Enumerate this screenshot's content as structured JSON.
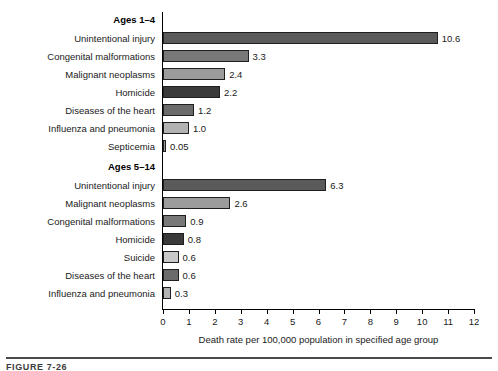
{
  "chart_data": {
    "type": "bar",
    "orientation": "horizontal",
    "title": "",
    "xlabel": "Death rate per 100,000 population in specified age group",
    "ylabel": "",
    "xlim": [
      0,
      12
    ],
    "xticks": [
      "0",
      "1",
      "2",
      "3",
      "4",
      "5",
      "6",
      "7",
      "8",
      "9",
      "10",
      "11",
      "12"
    ],
    "grid": false,
    "legend": "none",
    "panels": [
      {
        "name": "Ages 1–4",
        "categories": [
          "Unintentional injury",
          "Congenital malformations",
          "Malignant neoplasms",
          "Homicide",
          "Diseases of the heart",
          "Influenza and pneumonia",
          "Septicemia"
        ],
        "values": [
          10.6,
          3.3,
          2.4,
          2.2,
          1.2,
          1.0,
          0.05
        ],
        "value_labels": [
          "10.6",
          "3.3",
          "2.4",
          "2.2",
          "1.2",
          "1.0",
          "0.05"
        ],
        "colors": [
          "#5a5a5a",
          "#787878",
          "#9c9c9c",
          "#3a3a3a",
          "#6b6b6b",
          "#b2b2b2",
          "#9a9a9a"
        ]
      },
      {
        "name": "Ages 5–14",
        "categories": [
          "Unintentional injury",
          "Malignant neoplasms",
          "Congenital malformations",
          "Homicide",
          "Suicide",
          "Diseases of the heart",
          "Influenza and pneumonia"
        ],
        "values": [
          6.3,
          2.6,
          0.9,
          0.8,
          0.6,
          0.6,
          0.3
        ],
        "value_labels": [
          "6.3",
          "2.6",
          "0.9",
          "0.8",
          "0.6",
          "0.6",
          "0.3"
        ],
        "colors": [
          "#5a5a5a",
          "#9c9c9c",
          "#787878",
          "#3a3a3a",
          "#c8c8c8",
          "#6b6b6b",
          "#b2b2b2"
        ]
      }
    ]
  },
  "caption": {
    "text": "FIGURE 7-26"
  }
}
